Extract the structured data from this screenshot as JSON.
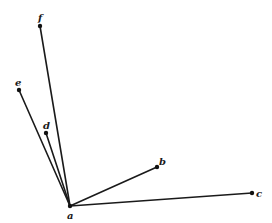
{
  "diagram": {
    "type": "star-graph",
    "center": "a",
    "nodes": [
      {
        "id": "a",
        "label": "a",
        "x": 70,
        "y": 206,
        "label_x": 67,
        "label_y": 219
      },
      {
        "id": "b",
        "label": "b",
        "x": 157,
        "y": 167,
        "label_x": 159,
        "label_y": 165
      },
      {
        "id": "c",
        "label": "c",
        "x": 252,
        "y": 193,
        "label_x": 256,
        "label_y": 197
      },
      {
        "id": "d",
        "label": "d",
        "x": 46,
        "y": 133,
        "label_x": 43,
        "label_y": 129
      },
      {
        "id": "e",
        "label": "e",
        "x": 19,
        "y": 90,
        "label_x": 15,
        "label_y": 86
      },
      {
        "id": "f",
        "label": "f",
        "x": 40,
        "y": 26,
        "label_x": 38,
        "label_y": 21
      }
    ],
    "edges": [
      {
        "from": "a",
        "to": "b"
      },
      {
        "from": "a",
        "to": "c"
      },
      {
        "from": "a",
        "to": "d"
      },
      {
        "from": "a",
        "to": "e"
      },
      {
        "from": "a",
        "to": "f"
      }
    ],
    "colors": {
      "line": "#1a1a1a",
      "dot": "#111111",
      "background": "#ffffff"
    }
  }
}
